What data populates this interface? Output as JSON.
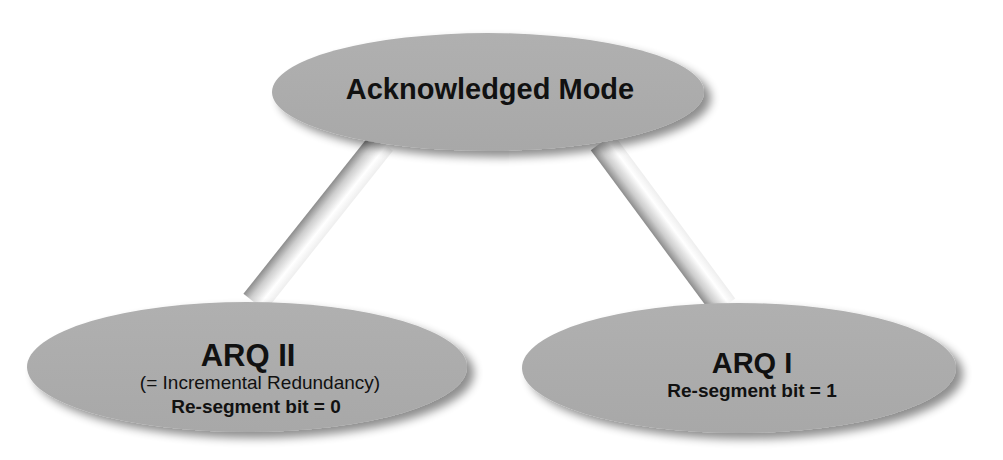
{
  "diagram": {
    "type": "hierarchy-tree",
    "colors": {
      "node_fill": "#ababab",
      "node_shadow": "#8a8a8a",
      "connector_light": "#ffffff",
      "connector_dark": "#8e8e8e",
      "text": "#111111",
      "background": "#ffffff"
    },
    "root": {
      "title": "Acknowledged Mode"
    },
    "children": [
      {
        "title": "ARQ II",
        "subtitle": "(= Incremental Redundancy)",
        "detail": "Re-segment bit = 0"
      },
      {
        "title": "ARQ I",
        "detail": "Re-segment bit = 1"
      }
    ],
    "edges": [
      {
        "from": "Acknowledged Mode",
        "to": "ARQ II"
      },
      {
        "from": "Acknowledged Mode",
        "to": "ARQ I"
      }
    ]
  }
}
